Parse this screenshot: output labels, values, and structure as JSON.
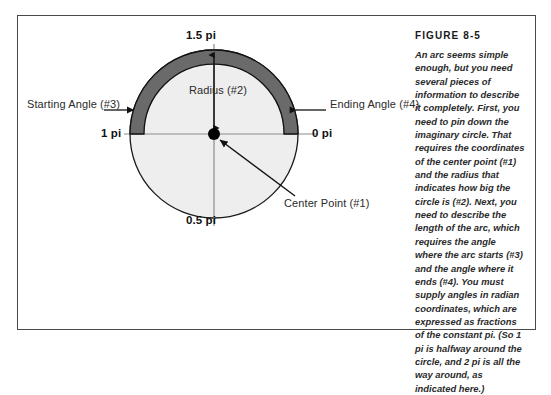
{
  "figure": {
    "heading": "FIGURE 8-5",
    "caption": "An arc seems simple enough, but you need several pieces of information to describe it completely. First, you need to pin down the imaginary circle. That requires the coordinates of the center point (#1) and the radius that indicates how big the circle is (#2). Next, you need to describe the length of the arc, which requires the angle where the arc starts (#3) and the angle where it ends (#4). You must supply angles in radian coordinates, which are expressed as fractions of the constant pi. (So 1 pi is halfway around the circle, and 2 pi is all the way around, as indicated here.)"
  },
  "diagram": {
    "angle_ticks": {
      "top": "1.5 pi",
      "left": "1 pi",
      "right": "0 pi",
      "bottom": "0.5 pi"
    },
    "callouts": {
      "radius": "Radius (#2)",
      "starting_angle": "Starting Angle (#3)",
      "ending_angle": "Ending Angle (#4)",
      "center_point": "Center Point (#1)"
    },
    "geometry": {
      "center_x": 214,
      "center_y": 134,
      "radius": 84,
      "arc_start_deg": 180,
      "arc_end_deg": 360,
      "arc_band_width": 14
    },
    "colors": {
      "arc_fill": "#6a6a6a",
      "arc_stroke": "#111111",
      "circle_fill": "#eeeeee",
      "circle_stroke": "#1a1a1a",
      "axis_line": "#8c8c8c",
      "frame_border": "#4a4a4a",
      "center_dot": "#000000"
    }
  }
}
